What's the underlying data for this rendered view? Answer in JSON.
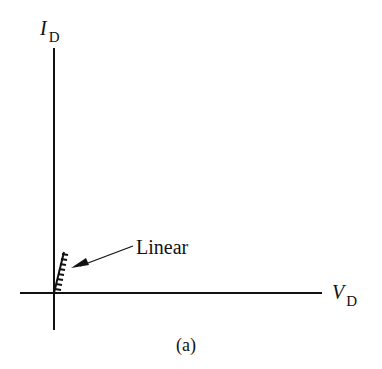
{
  "figure": {
    "y_axis_label": {
      "symbol": "I",
      "subscript": "D"
    },
    "x_axis_label": {
      "symbol": "V",
      "subscript": "D"
    },
    "annotation": "Linear",
    "caption": "(a)"
  },
  "colors": {
    "ink": "#111111",
    "background": "#ffffff"
  }
}
